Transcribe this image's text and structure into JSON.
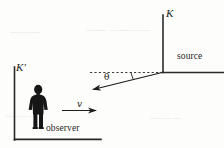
{
  "figure": {
    "type": "physics-diagram",
    "width": 224,
    "height": 148,
    "background_color": "#fdfdfc",
    "ink_color": "#1d1d1d"
  },
  "labels": {
    "frame_k": "K",
    "frame_k_prime": "K′",
    "source": "source",
    "observer": "observer",
    "angle": "θ",
    "velocity": "v"
  },
  "ghost_text": {
    "line_1": "———",
    "line_2": "—— ————",
    "line_3": "———",
    "line_4": "———"
  },
  "geometry": {
    "frame_k": {
      "origin": [
        163,
        72
      ],
      "vertical_axis": {
        "from": [
          163,
          72
        ],
        "to": [
          163,
          15
        ]
      },
      "horizontal_axis": {
        "from": [
          163,
          72
        ],
        "to": [
          224,
          72
        ]
      }
    },
    "frame_k_prime": {
      "origin": [
        14,
        140
      ],
      "vertical_axis": {
        "from": [
          14,
          140
        ],
        "to": [
          14,
          67
        ]
      },
      "horizontal_axis": {
        "from": [
          14,
          140
        ],
        "to": [
          101,
          140
        ]
      }
    },
    "light_ray": {
      "from": [
        163,
        72
      ],
      "to": [
        90,
        90
      ],
      "arrowhead": "to-end",
      "angle_degrees": 14
    },
    "reference_dashed_line": {
      "from": [
        90,
        72
      ],
      "to": [
        161,
        72
      ]
    },
    "velocity_arrow": {
      "from": [
        62,
        110
      ],
      "to": [
        100,
        110
      ],
      "arrowhead": "to-end"
    },
    "observer_figure": {
      "center_x": 38,
      "head_y": 86,
      "feet_y": 128
    }
  }
}
